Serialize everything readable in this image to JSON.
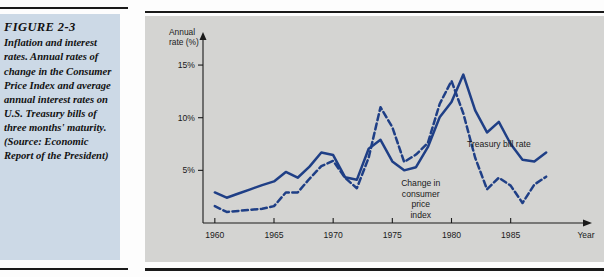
{
  "figure": {
    "number": "FIGURE 2-3",
    "caption": "Inflation and interest rates. Annual rates of change in the Consumer Price Index and average annual interest rates on U.S. Treasury bills of three months' maturity. (Source: Economic Report of the President)"
  },
  "chart_data": {
    "type": "line",
    "title": "",
    "xlabel": "Year",
    "ylabel": "Annual rate (%)",
    "ylabel_line1": "Annual",
    "ylabel_line2": "rate (%)",
    "xlim": [
      1959,
      1989
    ],
    "ylim": [
      0,
      17
    ],
    "grid": false,
    "legend": "inline-annotations",
    "y_ticks": [
      5,
      10,
      15
    ],
    "y_tick_labels": [
      "5%",
      "10%",
      "15%"
    ],
    "x_ticks": [
      1960,
      1965,
      1970,
      1975,
      1980,
      1985
    ],
    "x_tick_labels": [
      "1960",
      "1965",
      "1970",
      "1975",
      "1980",
      "1985"
    ],
    "x": [
      1960,
      1961,
      1962,
      1963,
      1964,
      1965,
      1966,
      1967,
      1968,
      1969,
      1970,
      1971,
      1972,
      1973,
      1974,
      1975,
      1976,
      1977,
      1978,
      1979,
      1980,
      1981,
      1982,
      1983,
      1984,
      1985,
      1986,
      1987,
      1988
    ],
    "series": [
      {
        "name": "Treasury bill rate",
        "style": "solid",
        "color": "#1f3f86",
        "label_x": 1984.0,
        "label_y": 7.2,
        "values": [
          2.9,
          2.4,
          2.8,
          3.2,
          3.6,
          3.95,
          4.85,
          4.3,
          5.35,
          6.7,
          6.45,
          4.35,
          4.1,
          7.05,
          7.9,
          5.85,
          5.0,
          5.3,
          7.2,
          10.05,
          11.5,
          14.1,
          10.7,
          8.6,
          9.6,
          7.5,
          6.0,
          5.85,
          6.7
        ]
      },
      {
        "name": "Change in consumer price index",
        "style": "dashed",
        "color": "#1f3f86",
        "label_x": 1977.4,
        "label_y": 3.5,
        "label_lines": [
          "Change in",
          "consumer",
          "price",
          "index"
        ],
        "values": [
          1.6,
          1.05,
          1.15,
          1.25,
          1.35,
          1.6,
          2.9,
          2.9,
          4.2,
          5.4,
          5.9,
          4.3,
          3.3,
          6.2,
          11.0,
          9.1,
          5.8,
          6.5,
          7.6,
          11.3,
          13.5,
          10.4,
          6.2,
          3.2,
          4.3,
          3.55,
          1.9,
          3.65,
          4.4
        ]
      }
    ]
  }
}
